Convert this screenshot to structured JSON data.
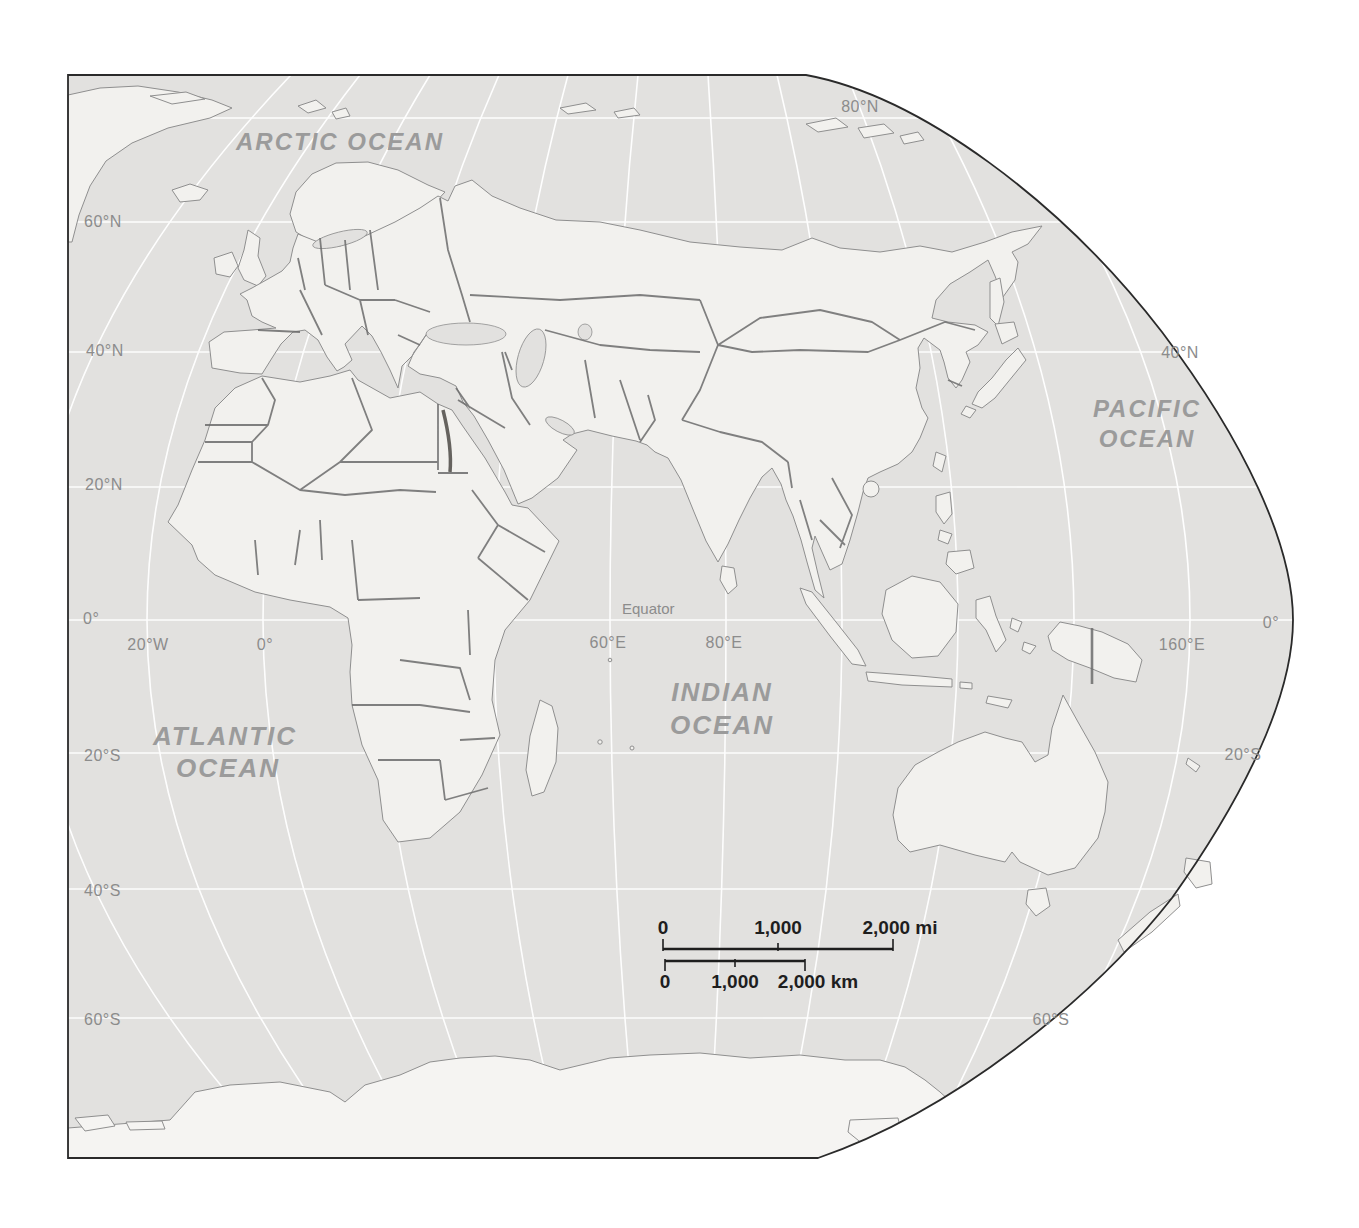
{
  "colors": {
    "page_bg": "#ffffff",
    "ocean": "#e2e1df",
    "land": "#f2f1ee",
    "antarctica": "#f5f4f2",
    "graticule": "#ffffff",
    "coastline": "#8f8f8f",
    "border": "#6c6c6c",
    "stipple": "#413f3a",
    "frame": "#2a2a2a",
    "ocean_label": "#9b9b9b",
    "graticule_label": "#8c8c8c",
    "scale_text": "#1e1e1e"
  },
  "labels": {
    "arctic_ocean": "ARCTIC  OCEAN",
    "pacific_ocean": [
      "PACIFIC",
      "OCEAN"
    ],
    "atlantic_ocean": [
      "ATLANTIC",
      "OCEAN"
    ],
    "indian_ocean": [
      "INDIAN",
      "OCEAN"
    ],
    "equator": "Equator"
  },
  "graticule_labels": {
    "left": [
      "60°N",
      "40°N",
      "20°N",
      "0°",
      "20°S",
      "40°S",
      "60°S"
    ],
    "right": [
      "80°N",
      "40°N",
      "0°",
      "20°S",
      "60°S"
    ],
    "longitude": [
      "20°W",
      "0°",
      "60°E",
      "80°E",
      "160°E"
    ]
  },
  "scale_bar": {
    "miles": {
      "ticks": [
        "0",
        "1,000",
        "2,000 mi"
      ]
    },
    "kilometers": {
      "ticks": [
        "0",
        "1,000",
        "2,000 km"
      ]
    }
  }
}
